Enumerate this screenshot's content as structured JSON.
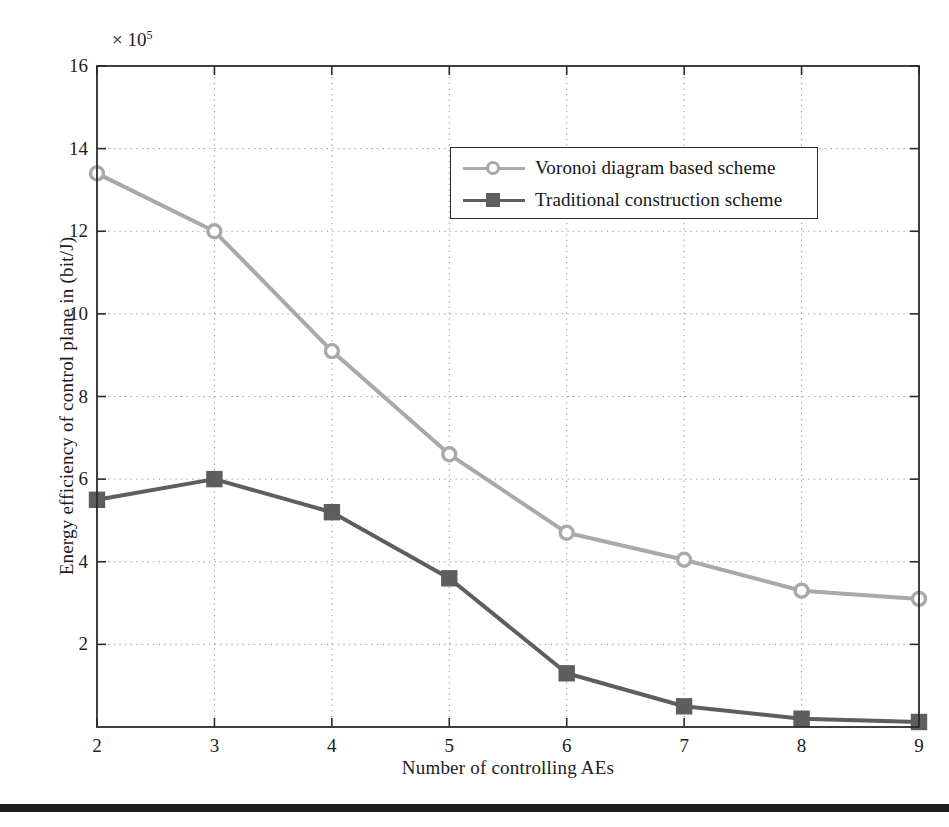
{
  "chart_data": {
    "type": "line",
    "title": "",
    "xlabel": "Number of controlling AEs",
    "ylabel": "Energy efficiency of control plane in (bit/J)",
    "y_exponent_label": "×10⁵",
    "y_exponent_base": "× 10",
    "y_exponent_power": "5",
    "x": [
      2,
      3,
      4,
      5,
      6,
      7,
      8,
      9
    ],
    "xlim": [
      2,
      9
    ],
    "ylim": [
      0,
      16
    ],
    "xticks": [
      "2",
      "3",
      "4",
      "5",
      "6",
      "7",
      "8",
      "9"
    ],
    "yticks": [
      "2",
      "4",
      "6",
      "8",
      "10",
      "12",
      "14",
      "16"
    ],
    "ytick_values": [
      2,
      4,
      6,
      8,
      10,
      12,
      14,
      16
    ],
    "grid": true,
    "grid_style": "dotted",
    "legend_position": "upper right",
    "series": [
      {
        "name": "Voronoi diagram based scheme",
        "color": "#a9a9a9",
        "marker": "circle",
        "values": [
          13.4,
          12.0,
          9.1,
          6.6,
          4.7,
          4.05,
          3.3,
          3.1
        ]
      },
      {
        "name": "Traditional construction scheme",
        "color": "#5e5e5e",
        "marker": "square",
        "values": [
          5.5,
          6.0,
          5.2,
          3.6,
          1.3,
          0.5,
          0.2,
          0.12
        ]
      }
    ]
  },
  "style": {
    "axis_color": "#2b2b2b",
    "grid_color": "#9a9a9a",
    "background": "#ffffff",
    "text_color": "#1c1c1c"
  }
}
